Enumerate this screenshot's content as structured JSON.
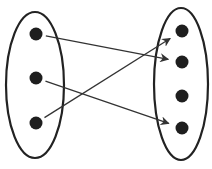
{
  "diagram": {
    "type": "mapping",
    "colors": {
      "stroke": "#222222",
      "dot": "#1e1e1e",
      "arrow": "#333333",
      "background": "#ffffff"
    },
    "domain_set": {
      "ellipse": {
        "cx": 35,
        "cy": 85,
        "rx": 29,
        "ry": 73
      },
      "elements": [
        {
          "id": "L1",
          "x": 36,
          "y": 34
        },
        {
          "id": "L2",
          "x": 36,
          "y": 78
        },
        {
          "id": "L3",
          "x": 36,
          "y": 123
        }
      ]
    },
    "codomain_set": {
      "ellipse": {
        "cx": 181,
        "cy": 84,
        "rx": 27,
        "ry": 76
      },
      "elements": [
        {
          "id": "R1",
          "x": 182,
          "y": 31
        },
        {
          "id": "R2",
          "x": 182,
          "y": 62
        },
        {
          "id": "R3",
          "x": 182,
          "y": 96
        },
        {
          "id": "R4",
          "x": 182,
          "y": 128
        }
      ]
    },
    "mappings": [
      {
        "from": "L1",
        "to": "R2"
      },
      {
        "from": "L2",
        "to": "R4"
      },
      {
        "from": "L3",
        "to": "R1"
      }
    ]
  }
}
